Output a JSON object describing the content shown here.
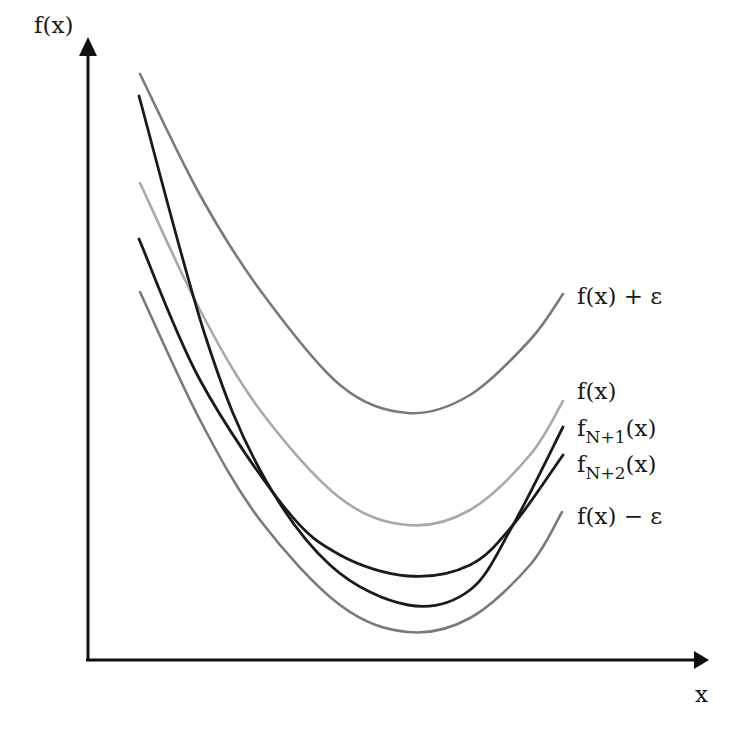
{
  "chart_data": {
    "type": "line",
    "title": "",
    "xlabel": "x",
    "ylabel": "f(x)",
    "grid": false,
    "axes": {
      "origin_px": [
        88,
        660
      ],
      "y_axis_top_px": [
        88,
        38
      ],
      "x_axis_right_px": [
        708,
        660
      ],
      "ticks": "none"
    },
    "series": [
      {
        "name": "f(x) + ε",
        "color": "#7a7a7a",
        "points_px": [
          [
            140,
            74
          ],
          [
            200,
            195
          ],
          [
            260,
            290
          ],
          [
            340,
            385
          ],
          [
            408,
            413
          ],
          [
            470,
            395
          ],
          [
            530,
            340
          ],
          [
            563,
            294
          ]
        ]
      },
      {
        "name": "f(x)",
        "color": "#a9a9a9",
        "points_px": [
          [
            140,
            183
          ],
          [
            200,
            310
          ],
          [
            260,
            410
          ],
          [
            340,
            498
          ],
          [
            408,
            525
          ],
          [
            470,
            510
          ],
          [
            530,
            455
          ],
          [
            563,
            401
          ]
        ]
      },
      {
        "name": "f_{N+1}(x)",
        "color": "#1a1a1a",
        "points_px": [
          [
            139,
            96
          ],
          [
            205,
            335
          ],
          [
            260,
            470
          ],
          [
            330,
            565
          ],
          [
            408,
            605
          ],
          [
            470,
            590
          ],
          [
            513,
            525
          ],
          [
            563,
            427
          ]
        ]
      },
      {
        "name": "f_{N+2}(x)",
        "color": "#1a1a1a",
        "points_px": [
          [
            139,
            239
          ],
          [
            200,
            380
          ],
          [
            285,
            508
          ],
          [
            340,
            555
          ],
          [
            408,
            576
          ],
          [
            470,
            565
          ],
          [
            513,
            525
          ],
          [
            563,
            455
          ]
        ]
      },
      {
        "name": "f(x) − ε",
        "color": "#7a7a7a",
        "points_px": [
          [
            140,
            292
          ],
          [
            200,
            420
          ],
          [
            260,
            520
          ],
          [
            340,
            605
          ],
          [
            408,
            632
          ],
          [
            470,
            618
          ],
          [
            530,
            565
          ],
          [
            562,
            512
          ]
        ]
      }
    ],
    "legend": "inline labels at right end of each curve"
  },
  "labels": {
    "y_axis": "f(x)",
    "x_axis": "x",
    "f_plus_eps": "f(x) + ε",
    "f": "f(x)",
    "fN1_base": "f",
    "fN1_sub": "N+1",
    "fN1_tail": "(x)",
    "fN2_base": "f",
    "fN2_sub": "N+2",
    "fN2_tail": "(x)",
    "f_minus_eps": "f(x) − ε"
  }
}
